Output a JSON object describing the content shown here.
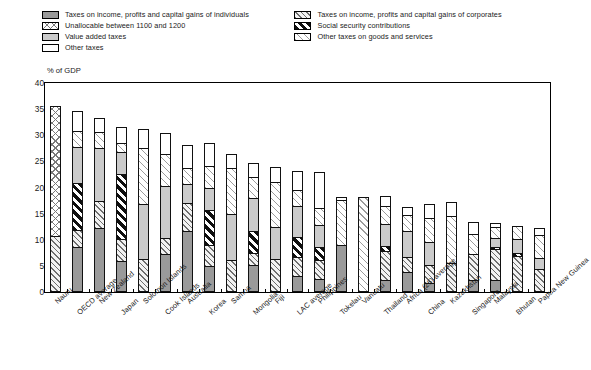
{
  "legend": {
    "left_column": [
      {
        "key": "individuals",
        "label": "Taxes on income, profits and capital gains of individuals",
        "pattern": "solid-grey"
      },
      {
        "key": "unallocable",
        "label": "Unallocable between 1100 and 1200",
        "pattern": "crosshatch"
      },
      {
        "key": "vat",
        "label": "Value added taxes",
        "pattern": "solid-light-grey"
      },
      {
        "key": "other",
        "label": "Other taxes",
        "pattern": "white"
      }
    ],
    "right_column": [
      {
        "key": "corporates",
        "label": "Taxes on income, profits and capital gains of corporates",
        "pattern": "diagonal-hatch"
      },
      {
        "key": "social",
        "label": "Social security contributions",
        "pattern": "bold-diagonal-black"
      },
      {
        "key": "goods",
        "label": "Other taxes on goods and services",
        "pattern": "fine-diagonal-hatch"
      }
    ]
  },
  "chart_data": {
    "type": "bar",
    "stacked": true,
    "title": "",
    "subtitle": "",
    "xlabel": "",
    "ylabel": "% of GDP",
    "ylim": [
      0,
      40
    ],
    "yticks": [
      0,
      5,
      10,
      15,
      20,
      25,
      30,
      35,
      40
    ],
    "grid": false,
    "legend_position": "top",
    "categories": [
      "Nauru",
      "OECD average",
      "New Zealand",
      "Japan",
      "Solomon Islands",
      "Cook Islands",
      "Australia",
      "Korea",
      "Samoa",
      "Mongolia",
      "Fiji",
      "LAC average",
      "Philippines",
      "Tokelau",
      "Vanuatu",
      "Thailand",
      "Africa (26) average",
      "China",
      "Kazakhstan",
      "Singapore",
      "Malaysia",
      "Bhutan",
      "Papua New Guinea"
    ],
    "series": [
      {
        "name": "Taxes on income, profits and capital gains of individuals",
        "key": "individuals",
        "values": [
          0.0,
          8.3,
          11.9,
          5.5,
          0.0,
          6.9,
          11.2,
          4.6,
          0.0,
          4.8,
          0.0,
          2.6,
          2.1,
          8.7,
          0.0,
          1.9,
          3.4,
          1.3,
          0.0,
          2.0,
          2.0,
          0.0,
          0.0
        ]
      },
      {
        "name": "Taxes on income, profits and capital gains of corporates",
        "key": "corporates",
        "values": [
          10.3,
          3.1,
          5.1,
          4.2,
          5.9,
          3.1,
          5.4,
          4.0,
          5.8,
          2.2,
          6.0,
          3.7,
          3.7,
          0.0,
          0.0,
          5.5,
          2.9,
          3.5,
          5.2,
          4.8,
          5.8,
          6.5,
          4.1
        ]
      },
      {
        "name": "Unallocable between 1100 and 1200",
        "key": "unallocable",
        "values": [
          25.0,
          0.0,
          0.0,
          0.0,
          0.0,
          0.0,
          0.0,
          0.0,
          0.0,
          0.0,
          0.0,
          0.0,
          0.0,
          0.0,
          0.0,
          0.0,
          0.0,
          0.0,
          0.0,
          0.0,
          0.0,
          0.0,
          0.0
        ]
      },
      {
        "name": "Social security contributions",
        "key": "social",
        "values": [
          0.0,
          9.1,
          0.0,
          12.6,
          0.0,
          0.0,
          0.0,
          6.8,
          0.0,
          4.3,
          0.0,
          3.8,
          2.4,
          0.0,
          0.0,
          1.1,
          0.0,
          0.0,
          0.0,
          0.0,
          0.5,
          0.6,
          0.0
        ]
      },
      {
        "name": "Value added taxes",
        "key": "vat",
        "values": [
          0.0,
          6.8,
          10.2,
          4.2,
          10.6,
          9.9,
          3.6,
          4.2,
          8.7,
          6.4,
          6.1,
          6.0,
          4.3,
          0.0,
          0.0,
          4.2,
          5.0,
          4.4,
          0.0,
          0.0,
          1.6,
          2.6,
          2.0
        ]
      },
      {
        "name": "Other taxes on goods and services",
        "key": "goods",
        "values": [
          0.0,
          3.2,
          3.1,
          1.7,
          10.6,
          6.1,
          3.1,
          4.1,
          8.8,
          4.0,
          8.5,
          3.0,
          3.2,
          8.6,
          17.8,
          3.3,
          3.1,
          4.6,
          9.0,
          3.9,
          2.1,
          2.5,
          4.4
        ]
      },
      {
        "name": "Other taxes",
        "key": "other",
        "values": [
          0.0,
          3.8,
          2.6,
          3.0,
          3.7,
          4.0,
          4.4,
          4.4,
          2.7,
          2.6,
          2.9,
          3.6,
          6.8,
          0.5,
          0.0,
          1.9,
          1.4,
          2.7,
          2.6,
          2.3,
          0.8,
          0.0,
          1.4
        ]
      }
    ],
    "totals": [
      35.3,
      34.3,
      32.9,
      31.2,
      30.8,
      30.0,
      27.7,
      28.1,
      26.0,
      24.3,
      23.5,
      22.7,
      22.5,
      17.8,
      17.8,
      17.9,
      15.8,
      16.5,
      16.8,
      13.0,
      12.8,
      12.2,
      11.9
    ]
  }
}
